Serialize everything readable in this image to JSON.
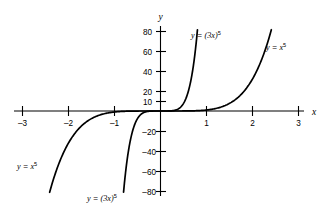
{
  "chart_data": {
    "type": "line",
    "title": "",
    "xlabel": "x",
    "ylabel": "y",
    "xlim": [
      -3.2,
      3.2
    ],
    "ylim": [
      -84,
      84
    ],
    "grid": false,
    "legend": "inline-annotations",
    "x_ticks": [
      -3,
      -2,
      -1,
      1,
      2,
      3
    ],
    "x_tick_labels": [
      "–3",
      "–2",
      "–1",
      "1",
      "2",
      "3"
    ],
    "y_ticks": [
      80,
      60,
      40,
      20,
      10,
      -20,
      -40,
      -60,
      -80
    ],
    "y_tick_labels": [
      "80",
      "60",
      "40",
      "20",
      "10",
      "–20",
      "–40",
      "–60",
      "–80"
    ],
    "series": [
      {
        "name": "y = x^5",
        "formula": "x^5",
        "x": [
          -2.41,
          -2.2,
          -2.0,
          -1.8,
          -1.6,
          -1.4,
          -1.2,
          -1.0,
          -0.8,
          -0.6,
          -0.4,
          -0.2,
          0,
          0.2,
          0.4,
          0.6,
          0.8,
          1.0,
          1.2,
          1.4,
          1.6,
          1.8,
          2.0,
          2.2,
          2.41
        ],
        "y": [
          -81.3,
          -51.5,
          -32.0,
          -18.9,
          -10.5,
          -5.38,
          -2.49,
          -1.0,
          -0.33,
          -0.078,
          -0.01,
          -0.0003,
          0,
          0.0003,
          0.01,
          0.078,
          0.33,
          1.0,
          2.49,
          5.38,
          10.5,
          18.9,
          32.0,
          51.5,
          81.3
        ]
      },
      {
        "name": "y = (3x)^5",
        "formula": "(3x)^5",
        "x": [
          -0.803,
          -0.75,
          -0.7,
          -0.65,
          -0.6,
          -0.55,
          -0.5,
          -0.45,
          -0.4,
          -0.3,
          -0.2,
          -0.1,
          0,
          0.1,
          0.2,
          0.3,
          0.4,
          0.45,
          0.5,
          0.55,
          0.6,
          0.65,
          0.7,
          0.75,
          0.803
        ],
        "y": [
          -80.7,
          -57.7,
          -40.0,
          -27.1,
          -17.5,
          -11.2,
          -7.59,
          -4.98,
          -3.11,
          -0.98,
          -0.19,
          -0.024,
          0,
          0.024,
          0.19,
          0.98,
          3.11,
          4.98,
          7.59,
          11.2,
          17.5,
          27.1,
          40.0,
          57.7,
          80.7
        ]
      }
    ],
    "annotations": [
      {
        "id": "label-3x5-top",
        "text": "y = (3x)⁵",
        "x_data": 0.95,
        "y_data": 73
      },
      {
        "id": "label-x5-top",
        "text": "y = x⁵",
        "x_data": 2.55,
        "y_data": 62
      },
      {
        "id": "label-x5-bottom",
        "text": "y = x⁵",
        "x_data": -2.8,
        "y_data": -56
      },
      {
        "id": "label-3x5-bottom",
        "text": "y = (3x)⁵",
        "x_data": -1.1,
        "y_data": -80
      }
    ]
  },
  "figure": {
    "axis_label_x": "x",
    "axis_label_y": "y",
    "x_tick_labels": [
      "–3",
      "–2",
      "–1",
      "1",
      "2",
      "3"
    ],
    "y_tick_labels": [
      "80",
      "60",
      "40",
      "20",
      "10",
      "–20",
      "–40",
      "–60",
      "–80"
    ],
    "labels": {
      "top_inner": {
        "lhs": "y",
        "eq": "=",
        "base": "(3x)",
        "exp": "5"
      },
      "top_outer": {
        "lhs": "y",
        "eq": "=",
        "base": "x",
        "exp": "5"
      },
      "bottom_outer": {
        "lhs": "y",
        "eq": "=",
        "base": "x",
        "exp": "5"
      },
      "bottom_inner": {
        "lhs": "y",
        "eq": "=",
        "base": "(3x)",
        "exp": "5"
      }
    },
    "colors": {
      "ink": "#000000",
      "background": "#ffffff"
    }
  }
}
